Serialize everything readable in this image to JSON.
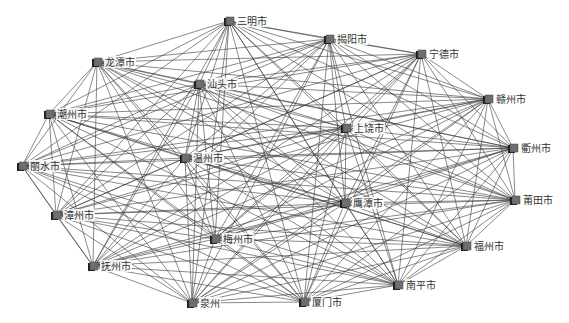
{
  "diagram": {
    "type": "network-graph",
    "edge_color": "#3a3a3a",
    "node_color": "#6e6e6e",
    "node_dark": "#1e1e1e",
    "nodes": [
      {
        "id": "sanming",
        "label": "三明市",
        "x": 229,
        "y": 21
      },
      {
        "id": "jieyang",
        "label": "揭阳市",
        "x": 329,
        "y": 39
      },
      {
        "id": "ningde",
        "label": "宁德市",
        "x": 421,
        "y": 54
      },
      {
        "id": "ganzhou",
        "label": "赣州市",
        "x": 488,
        "y": 99
      },
      {
        "id": "quzhou",
        "label": "衢州市",
        "x": 513,
        "y": 148
      },
      {
        "id": "putian",
        "label": "莆田市",
        "x": 515,
        "y": 200
      },
      {
        "id": "fuzhou",
        "label": "福州市",
        "x": 466,
        "y": 246
      },
      {
        "id": "nanping",
        "label": "南平市",
        "x": 398,
        "y": 285
      },
      {
        "id": "xiamen",
        "label": "厦门市",
        "x": 304,
        "y": 302
      },
      {
        "id": "quanzhou",
        "label": "泉州",
        "x": 192,
        "y": 303
      },
      {
        "id": "fuzhou2",
        "label": "抚州市",
        "x": 93,
        "y": 266
      },
      {
        "id": "zhangzhou",
        "label": "漳州市",
        "x": 56,
        "y": 215
      },
      {
        "id": "lishui",
        "label": "丽水市",
        "x": 22,
        "y": 166
      },
      {
        "id": "chaozhou",
        "label": "潮州市",
        "x": 49,
        "y": 114
      },
      {
        "id": "longtan",
        "label": "龙潭市",
        "x": 97,
        "y": 62
      },
      {
        "id": "shantou",
        "label": "汕头市",
        "x": 199,
        "y": 84
      },
      {
        "id": "wenzhou",
        "label": "温州市",
        "x": 185,
        "y": 158
      },
      {
        "id": "shangrao",
        "label": "上饶市",
        "x": 346,
        "y": 128
      },
      {
        "id": "yingtan",
        "label": "鹰潭市",
        "x": 345,
        "y": 203
      },
      {
        "id": "meizhou",
        "label": "梅州市",
        "x": 215,
        "y": 239
      }
    ],
    "edges": "complete"
  }
}
